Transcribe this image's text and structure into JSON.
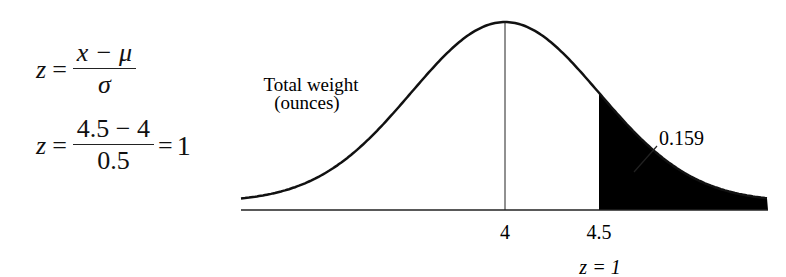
{
  "formulas": {
    "general": {
      "lhs": "z",
      "eq": "=",
      "numerator": "x − μ",
      "denominator": "σ"
    },
    "applied": {
      "lhs": "z",
      "eq": "=",
      "numerator": "4.5 − 4",
      "denominator": "0.5",
      "result_eq": "=",
      "result": "1"
    }
  },
  "diagram": {
    "title_line1": "Total weight",
    "title_line2": "(ounces)",
    "tick_mean": "4",
    "tick_x": "4.5",
    "z_label": "z = 1",
    "area_label": "0.159"
  },
  "chart_data": {
    "type": "area",
    "title": "Total weight (ounces)",
    "distribution": "normal",
    "mean": 4,
    "sd": 0.5,
    "x_ticks": [
      "4",
      "4.5"
    ],
    "shaded_region": {
      "from": 4.5,
      "to": "infinity",
      "area": 0.159
    },
    "annotations": [
      "z = 1",
      "0.159"
    ],
    "grid": false
  }
}
